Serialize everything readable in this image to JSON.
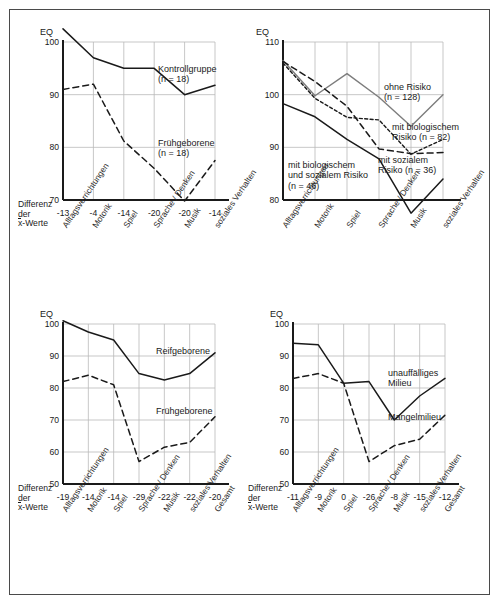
{
  "figure": {
    "axis_unit_label": "EQ",
    "difference_label_line1": "Differenz",
    "difference_label_line2": "der",
    "difference_label_line3_prefix": "x",
    "difference_label_line3_suffix": "-Werte"
  },
  "chart_data": [
    {
      "id": "top-left",
      "type": "line",
      "title": "",
      "ylabel": "EQ",
      "xlabel": "",
      "ylim": [
        70,
        100
      ],
      "yticks": [
        70,
        80,
        90,
        100
      ],
      "grid": true,
      "legend_position": "inline-right",
      "categories": [
        "Alltagsverrichtungen",
        "Motorik",
        "Spiel",
        "Sprache / Denken",
        "Musik",
        "soziales Verhalten"
      ],
      "difference_values": [
        "-13",
        "-4",
        "-14",
        "-20",
        "-20",
        "-14"
      ],
      "series": [
        {
          "name": "Kontrollgruppe",
          "n_label": "(n = 18)",
          "style": "solid",
          "values": [
            102.5,
            97,
            95,
            95,
            90,
            91.8
          ]
        },
        {
          "name": "Frühgeborene",
          "n_label": "(n = 18)",
          "style": "dashed",
          "values": [
            91,
            92,
            81.2,
            76,
            69.8,
            77.5
          ]
        }
      ]
    },
    {
      "id": "top-right",
      "type": "line",
      "title": "",
      "ylabel": "EQ",
      "xlabel": "",
      "ylim": [
        80,
        110
      ],
      "yticks": [
        80,
        90,
        100,
        110
      ],
      "grid": true,
      "legend_position": "inline-right",
      "categories": [
        "Alltagsverrichtungen",
        "Motorik",
        "Spiel",
        "Sprache / Denken",
        "Musik",
        "soziales Verhalten"
      ],
      "difference_values": [],
      "series": [
        {
          "name": "ohne Risiko",
          "n_label": "(n = 128)",
          "style": "solid-gray",
          "values": [
            106.5,
            99.8,
            104,
            99.5,
            94,
            100
          ]
        },
        {
          "name": "mit biologischem Risiko",
          "n_label": "(n = 82)",
          "style": "dotted",
          "values": [
            106,
            99.3,
            95.7,
            95.2,
            88.7,
            91.5
          ]
        },
        {
          "name": "mit sozialem Risiko",
          "n_label": "(n = 36)",
          "style": "dashed",
          "values": [
            106.3,
            102.5,
            97.8,
            89.7,
            88.8,
            89
          ]
        },
        {
          "name": "mit biologischem und sozialem Risiko",
          "n_label": "(n = 46)",
          "style": "solid",
          "values": [
            98.3,
            95.8,
            91.5,
            87.8,
            77.5,
            84
          ]
        }
      ]
    },
    {
      "id": "bottom-left",
      "type": "line",
      "title": "",
      "ylabel": "EQ",
      "xlabel": "",
      "ylim": [
        50,
        100
      ],
      "yticks": [
        50,
        60,
        70,
        80,
        90,
        100
      ],
      "grid": true,
      "legend_position": "inline-right",
      "categories": [
        "Alltagsverrichtungen",
        "Motorik",
        "Spiel",
        "Sprache / Denken",
        "Musik",
        "soziales Verhalten",
        "Gesamt"
      ],
      "difference_values": [
        "-19",
        "-14",
        "-14",
        "-29",
        "-22",
        "-22",
        "-20"
      ],
      "series": [
        {
          "name": "Reifgeborene",
          "n_label": "",
          "style": "solid",
          "values": [
            101,
            97.5,
            95,
            84.5,
            82.5,
            84.5,
            91
          ]
        },
        {
          "name": "Frühgeborene",
          "n_label": "",
          "style": "dashed",
          "values": [
            82,
            84,
            81,
            57,
            61.5,
            63,
            71
          ]
        }
      ]
    },
    {
      "id": "bottom-right",
      "type": "line",
      "title": "",
      "ylabel": "EQ",
      "xlabel": "",
      "ylim": [
        50,
        100
      ],
      "yticks": [
        50,
        60,
        70,
        80,
        90,
        100
      ],
      "grid": true,
      "legend_position": "inline-right",
      "categories": [
        "Alltagsverrichtungen",
        "Motorik",
        "Spiel",
        "Sprache / Denken",
        "Musik",
        "soziales Verhalten",
        "Gesamt"
      ],
      "difference_values": [
        "-11",
        "-9",
        "0",
        "-26",
        "-8",
        "-15",
        "-12"
      ],
      "series": [
        {
          "name": "unauffälliges Milieu",
          "n_label": "",
          "style": "solid",
          "values": [
            94,
            93.5,
            81.5,
            82,
            70,
            77.5,
            83
          ]
        },
        {
          "name": "Mangelmilieu",
          "n_label": "",
          "style": "dashed",
          "values": [
            83,
            84.5,
            81.5,
            57,
            62,
            64,
            71.5
          ]
        }
      ]
    }
  ],
  "colors": {
    "frame": "#4a4a4a",
    "axis": "#1a1a1a",
    "grid": "#b9b9b9",
    "line_solid": "#1a1a1a",
    "line_gray": "#7d7d7d",
    "background": "#ffffff"
  },
  "panels": {
    "top_left": {
      "legend": [
        {
          "name": "Kontrollgruppe",
          "n_label": "(n = 18)"
        },
        {
          "name": "Frühgeborene",
          "n_label": "(n = 18)"
        }
      ]
    },
    "top_right": {
      "legend": [
        {
          "name": "ohne Risiko",
          "n_label": "(n = 128)"
        },
        {
          "name": "mit biologischem",
          "n_label": "Risiko (n = 82)"
        },
        {
          "name": "mit sozialem",
          "n_label": "Risiko (n = 36)"
        },
        {
          "name": "mit biologischem",
          "n_label": "und sozialem Risiko",
          "n_label2": "(n = 46)"
        }
      ]
    },
    "bottom_left": {
      "legend": [
        {
          "name": "Reifgeborene",
          "n_label": ""
        },
        {
          "name": "Frühgeborene",
          "n_label": ""
        }
      ]
    },
    "bottom_right": {
      "legend": [
        {
          "name": "unauffälliges",
          "n_label": "Milieu"
        },
        {
          "name": "Mangelmilieu",
          "n_label": ""
        }
      ]
    }
  }
}
